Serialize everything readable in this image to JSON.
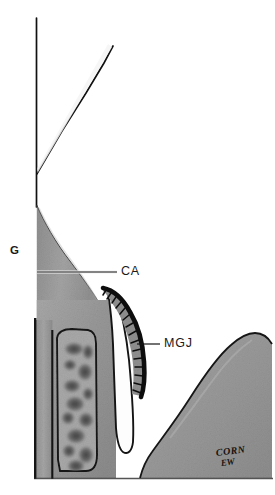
{
  "figure": {
    "background_color": "#ffffff",
    "width": 275,
    "height": 495
  },
  "labels": [
    {
      "id": "G",
      "text": "G",
      "meaning": "gingiva",
      "x": 10,
      "y": 245,
      "has_leader": false
    },
    {
      "id": "CA",
      "text": "CA",
      "meaning": "cemento-enamel / alveolar crest",
      "x": 121,
      "y": 265,
      "has_leader": true,
      "leader": {
        "x1": 37,
        "y1": 272,
        "x2": 117,
        "y2": 272
      }
    },
    {
      "id": "MGJ",
      "text": "MGJ",
      "meaning": "mucogingival junction",
      "x": 164,
      "y": 337,
      "has_leader": true,
      "leader": {
        "x1": 137,
        "y1": 344,
        "x2": 160,
        "y2": 344
      }
    }
  ],
  "signature": {
    "name": "CORN",
    "initials": "EW"
  },
  "tissues": {
    "gingiva_fill": "#9a9a9a",
    "bone_fill": "#9c9c9c",
    "marrow_fill": "#585858",
    "pdl_space_fill": "#fdfdfd",
    "outline_color": "#1a1a1a",
    "tooth_fill": "#ffffff",
    "leader_color": "#111111"
  },
  "colors": {
    "accent": "#1a1a1a",
    "paper": "#ffffff"
  }
}
